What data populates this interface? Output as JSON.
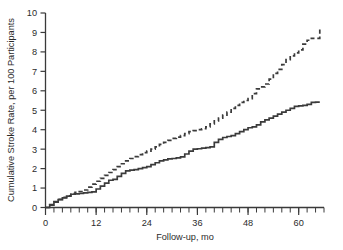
{
  "chart_data": {
    "type": "line",
    "title": "",
    "xlabel": "Follow-up, mo",
    "ylabel": "Cumulative Stroke Rate, per 100 Participants",
    "xlim": [
      0,
      66
    ],
    "ylim": [
      0,
      10
    ],
    "grid": false,
    "legend_position": "none",
    "xticks": [
      0,
      12,
      24,
      36,
      48,
      60
    ],
    "xtick_labels": [
      "0",
      "12",
      "24",
      "36",
      "48",
      "60"
    ],
    "x_minor_tick_interval": 2,
    "yticks": [
      0,
      1,
      2,
      3,
      4,
      5,
      6,
      7,
      8,
      9,
      10
    ],
    "ytick_labels": [
      "0",
      "1",
      "2",
      "3",
      "4",
      "5",
      "6",
      "7",
      "8",
      "9",
      "10"
    ],
    "series": [
      {
        "name": "Dashed curve",
        "style": "dashed",
        "color": "#3b3b3b",
        "x": [
          0,
          1,
          2,
          3,
          4,
          5,
          6,
          7,
          8,
          9,
          10,
          11,
          12,
          13,
          14,
          15,
          16,
          17,
          18,
          19,
          20,
          21,
          22,
          23,
          24,
          25,
          26,
          27,
          28,
          29,
          30,
          31,
          32,
          33,
          34,
          35,
          36,
          37,
          38,
          39,
          40,
          41,
          42,
          43,
          44,
          45,
          46,
          47,
          48,
          49,
          50,
          51,
          52,
          53,
          54,
          55,
          56,
          57,
          58,
          59,
          60,
          61,
          62,
          63,
          64,
          65
        ],
        "y": [
          0.0,
          0.15,
          0.3,
          0.42,
          0.52,
          0.6,
          0.72,
          0.78,
          0.82,
          0.9,
          1.05,
          1.2,
          1.35,
          1.5,
          1.65,
          1.8,
          1.95,
          2.1,
          2.25,
          2.4,
          2.52,
          2.62,
          2.72,
          2.82,
          2.9,
          3.0,
          3.12,
          3.25,
          3.35,
          3.45,
          3.55,
          3.62,
          3.7,
          3.8,
          3.9,
          3.95,
          4.0,
          4.05,
          4.15,
          4.3,
          4.45,
          4.6,
          4.75,
          4.9,
          5.1,
          5.25,
          5.4,
          5.5,
          5.6,
          5.85,
          6.1,
          6.2,
          6.35,
          6.6,
          6.9,
          7.1,
          7.35,
          7.6,
          7.8,
          7.95,
          8.1,
          8.4,
          8.6,
          8.7,
          8.7,
          9.2
        ]
      },
      {
        "name": "Solid curve",
        "style": "solid",
        "color": "#3b3b3b",
        "x": [
          0,
          1,
          2,
          3,
          4,
          5,
          6,
          7,
          8,
          9,
          10,
          11,
          12,
          13,
          14,
          15,
          16,
          17,
          18,
          19,
          20,
          21,
          22,
          23,
          24,
          25,
          26,
          27,
          28,
          29,
          30,
          31,
          32,
          33,
          34,
          35,
          36,
          37,
          38,
          39,
          40,
          41,
          42,
          43,
          44,
          45,
          46,
          47,
          48,
          49,
          50,
          51,
          52,
          53,
          54,
          55,
          56,
          57,
          58,
          59,
          60,
          61,
          62,
          63,
          64,
          65
        ],
        "y": [
          0.0,
          0.12,
          0.28,
          0.4,
          0.5,
          0.58,
          0.68,
          0.7,
          0.72,
          0.75,
          0.78,
          0.8,
          0.95,
          1.1,
          1.25,
          1.4,
          1.45,
          1.6,
          1.75,
          1.88,
          1.92,
          1.95,
          2.0,
          2.05,
          2.1,
          2.2,
          2.3,
          2.4,
          2.45,
          2.5,
          2.52,
          2.55,
          2.6,
          2.75,
          2.9,
          3.0,
          3.02,
          3.05,
          3.08,
          3.12,
          3.35,
          3.5,
          3.6,
          3.65,
          3.7,
          3.8,
          3.9,
          4.0,
          4.1,
          4.15,
          4.25,
          4.4,
          4.5,
          4.6,
          4.7,
          4.8,
          4.9,
          5.0,
          5.1,
          5.2,
          5.22,
          5.25,
          5.3,
          5.4,
          5.42,
          5.42
        ]
      }
    ]
  },
  "figure": {
    "y_axis_title": "Cumulative Stroke Rate, per 100 Participants",
    "x_axis_title": "Follow-up, mo"
  }
}
